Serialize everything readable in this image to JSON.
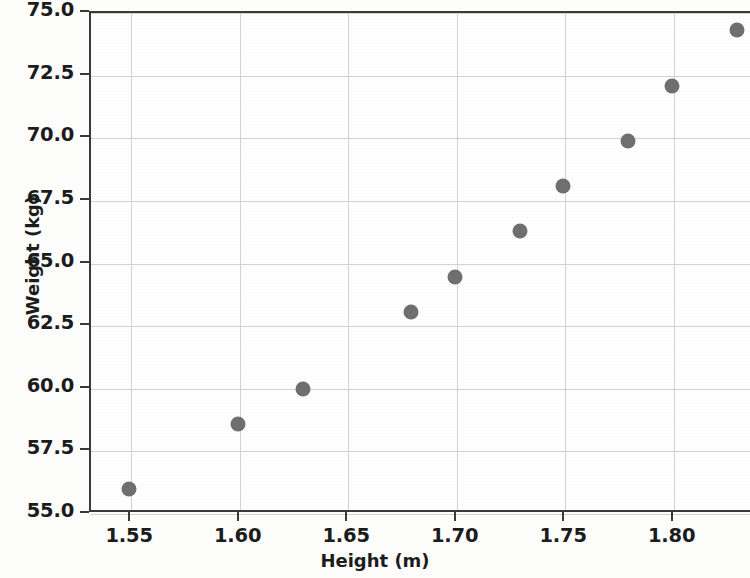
{
  "chart_data": {
    "type": "scatter",
    "title": "",
    "xlabel": "Height (m)",
    "ylabel": "Weight (kg)",
    "xlim": [
      1.5315,
      1.8361
    ],
    "ylim": [
      55.0,
      75.0
    ],
    "xticks": [
      "1.55",
      "1.60",
      "1.65",
      "1.70",
      "1.75",
      "1.80"
    ],
    "xtick_values": [
      1.55,
      1.6,
      1.65,
      1.7,
      1.75,
      1.8
    ],
    "yticks": [
      "55.0",
      "57.5",
      "60.0",
      "62.5",
      "65.0",
      "67.5",
      "70.0",
      "72.5",
      "75.0"
    ],
    "ytick_values": [
      55.0,
      57.5,
      60.0,
      62.5,
      65.0,
      67.5,
      70.0,
      72.5,
      75.0
    ],
    "grid": true,
    "legend": null,
    "marker_color": "#6f6f6f",
    "axis_color": "#3a3a3a",
    "grid_color": "#d2d2d2",
    "x": [
      1.55,
      1.6,
      1.63,
      1.68,
      1.7,
      1.73,
      1.75,
      1.78,
      1.8,
      1.83
    ],
    "y": [
      55.9,
      58.5,
      59.9,
      63.0,
      64.4,
      66.2,
      68.0,
      69.8,
      72.0,
      74.25
    ],
    "points": [
      {
        "x": 1.55,
        "y": 55.9
      },
      {
        "x": 1.6,
        "y": 58.5
      },
      {
        "x": 1.63,
        "y": 59.9
      },
      {
        "x": 1.68,
        "y": 63.0
      },
      {
        "x": 1.7,
        "y": 64.4
      },
      {
        "x": 1.73,
        "y": 66.2
      },
      {
        "x": 1.75,
        "y": 68.0
      },
      {
        "x": 1.78,
        "y": 69.8
      },
      {
        "x": 1.8,
        "y": 72.0
      },
      {
        "x": 1.83,
        "y": 74.25
      }
    ]
  }
}
